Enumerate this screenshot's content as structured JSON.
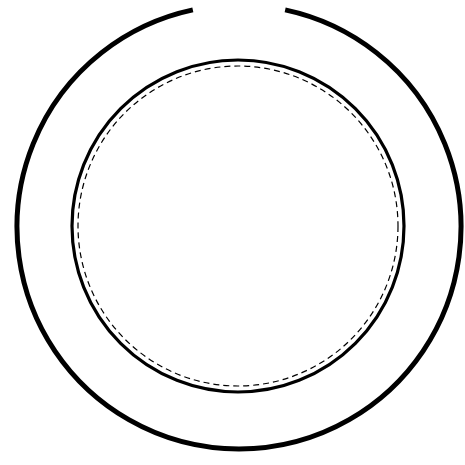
{
  "diagram": {
    "background": "#ffffff",
    "stroke_color": "#000000",
    "outer_ring": {
      "cx": 239,
      "cy": 227,
      "r": 222,
      "stroke_width": 5,
      "gap_start_deg": 258,
      "gap_end_deg": 282
    },
    "inner_circle": {
      "cx": 238,
      "cy": 226,
      "r": 166,
      "stroke_width": 3.2
    },
    "dashed_circle": {
      "cx": 238,
      "cy": 226,
      "r": 160,
      "stroke_width": 1.2,
      "dash": "6 4"
    }
  }
}
